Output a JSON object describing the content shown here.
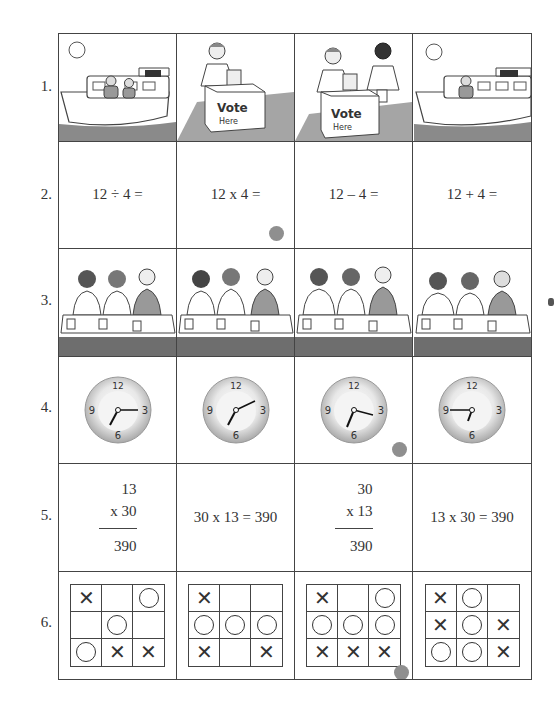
{
  "rows": [
    {
      "label": "1.",
      "type": "scene",
      "cells": [
        {
          "scene": "boat",
          "people": 2,
          "description": "sun over a boat on water with two people"
        },
        {
          "scene": "voting",
          "people": 1,
          "sign": "Vote Here",
          "description": "man casting a ballot into a box"
        },
        {
          "scene": "voting",
          "people": 2,
          "sign": "Vote Here",
          "description": "man casting a ballot, second man waiting"
        },
        {
          "scene": "boat",
          "people": 1,
          "description": "sun over a boat on water with one person"
        }
      ]
    },
    {
      "label": "2.",
      "type": "equation",
      "cells": [
        {
          "text": "12 ÷ 4 ="
        },
        {
          "text": "12 x 4 =",
          "marked": true
        },
        {
          "text": "12 – 4 ="
        },
        {
          "text": "12 + 4 ="
        }
      ]
    },
    {
      "label": "3.",
      "type": "scene",
      "cells": [
        {
          "scene": "eating",
          "eating": [
            true,
            true,
            true
          ]
        },
        {
          "scene": "eating",
          "eating": [
            true,
            false,
            false
          ]
        },
        {
          "scene": "eating",
          "eating": [
            false,
            false,
            false
          ]
        },
        {
          "scene": "eating",
          "eating": [
            false,
            false,
            true
          ]
        }
      ]
    },
    {
      "label": "4.",
      "type": "clock",
      "numbers": [
        "12",
        "3",
        "6",
        "9"
      ],
      "cells": [
        {
          "hour_angle": 205,
          "minute_angle": 90
        },
        {
          "hour_angle": 205,
          "minute_angle": 65
        },
        {
          "hour_angle": 205,
          "minute_angle": 105
        },
        {
          "hour_angle": 200,
          "minute_angle": 270,
          "note": "marked"
        }
      ]
    },
    {
      "label": "5.",
      "type": "multiplication",
      "cells": [
        {
          "kind": "vertical",
          "top": "13",
          "bottom": "x 30",
          "result": "390"
        },
        {
          "kind": "inline",
          "text": "30 x 13 = 390"
        },
        {
          "kind": "vertical",
          "top": "30",
          "bottom": "x 13",
          "result": "390"
        },
        {
          "kind": "inline",
          "text": "13 x 30 = 390"
        }
      ]
    },
    {
      "label": "6.",
      "type": "tictactoe",
      "cells": [
        {
          "board": [
            "X",
            "",
            "O",
            "",
            "O",
            "",
            "O",
            "X",
            "X"
          ]
        },
        {
          "board": [
            "X",
            "",
            "",
            "O",
            "O",
            "O",
            "X",
            "",
            "X"
          ]
        },
        {
          "board": [
            "X",
            "",
            "O",
            "O",
            "O",
            "O",
            "X",
            "X",
            "X"
          ],
          "marked": true
        },
        {
          "board": [
            "X",
            "O",
            "",
            "X",
            "O",
            "X",
            "O",
            "O",
            "X"
          ]
        }
      ]
    }
  ],
  "marks": [
    {
      "row": 2,
      "col": 2
    },
    {
      "row": 4,
      "col": 3
    },
    {
      "row": 6,
      "col": 3
    }
  ],
  "colors": {
    "grid_line": "#444444",
    "mark_dot": "#8f8f8f",
    "water": "#8a8a8a",
    "clock_rim": "#bdbdbd"
  }
}
